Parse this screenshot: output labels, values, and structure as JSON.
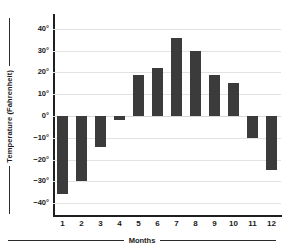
{
  "chart_data": {
    "type": "bar",
    "title": "",
    "xlabel": "Months",
    "ylabel": "Temperature (Fahrenheit)",
    "categories": [
      "1",
      "2",
      "3",
      "4",
      "5",
      "6",
      "7",
      "8",
      "9",
      "10",
      "11",
      "12"
    ],
    "values": [
      -36,
      -30,
      -14,
      -2,
      19,
      22,
      36,
      30,
      19,
      15,
      -10,
      -25
    ],
    "ylim": [
      -45,
      45
    ],
    "yticks": [
      40,
      30,
      20,
      10,
      0,
      -10,
      -20,
      -30,
      -40
    ],
    "ytick_labels": [
      "40°",
      "30°",
      "20°",
      "10°",
      "0°",
      "−10°",
      "−20°",
      "−30°",
      "−40°"
    ],
    "grid": true,
    "legend": "none",
    "bar_color": "#3b3b3b",
    "grid_color": "#e2e2e2",
    "axis_color": "#1f1f1f"
  }
}
